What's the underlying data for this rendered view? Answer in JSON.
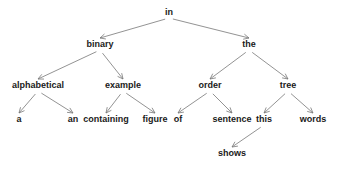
{
  "diagram": {
    "type": "tree",
    "colors": {
      "edge": "#777777",
      "text": "#1a1a1a",
      "background": "#ffffff"
    },
    "nodes": [
      {
        "id": "in",
        "label": "in",
        "x": 169,
        "y": 15
      },
      {
        "id": "binary",
        "label": "binary",
        "x": 100,
        "y": 47
      },
      {
        "id": "the",
        "label": "the",
        "x": 249,
        "y": 47
      },
      {
        "id": "alphabetical",
        "label": "alphabetical",
        "x": 38,
        "y": 88
      },
      {
        "id": "example",
        "label": "example",
        "x": 123,
        "y": 88
      },
      {
        "id": "order",
        "label": "order",
        "x": 210,
        "y": 88
      },
      {
        "id": "tree",
        "label": "tree",
        "x": 288,
        "y": 88
      },
      {
        "id": "a",
        "label": "a",
        "x": 19,
        "y": 122
      },
      {
        "id": "an",
        "label": "an",
        "x": 73,
        "y": 122
      },
      {
        "id": "containing",
        "label": "containing",
        "x": 106,
        "y": 122
      },
      {
        "id": "figure",
        "label": "figure",
        "x": 155,
        "y": 122
      },
      {
        "id": "of",
        "label": "of",
        "x": 178,
        "y": 122
      },
      {
        "id": "sentence",
        "label": "sentence",
        "x": 232,
        "y": 122
      },
      {
        "id": "this",
        "label": "this",
        "x": 264,
        "y": 122
      },
      {
        "id": "words",
        "label": "words",
        "x": 313,
        "y": 122
      },
      {
        "id": "shows",
        "label": "shows",
        "x": 232,
        "y": 156
      }
    ],
    "edges": [
      {
        "from": "in",
        "to": "binary"
      },
      {
        "from": "in",
        "to": "the"
      },
      {
        "from": "binary",
        "to": "alphabetical"
      },
      {
        "from": "binary",
        "to": "example"
      },
      {
        "from": "the",
        "to": "order"
      },
      {
        "from": "the",
        "to": "tree"
      },
      {
        "from": "alphabetical",
        "to": "a"
      },
      {
        "from": "alphabetical",
        "to": "an"
      },
      {
        "from": "example",
        "to": "containing"
      },
      {
        "from": "example",
        "to": "figure"
      },
      {
        "from": "order",
        "to": "of"
      },
      {
        "from": "order",
        "to": "sentence"
      },
      {
        "from": "tree",
        "to": "this"
      },
      {
        "from": "tree",
        "to": "words"
      },
      {
        "from": "this",
        "to": "shows"
      }
    ]
  }
}
